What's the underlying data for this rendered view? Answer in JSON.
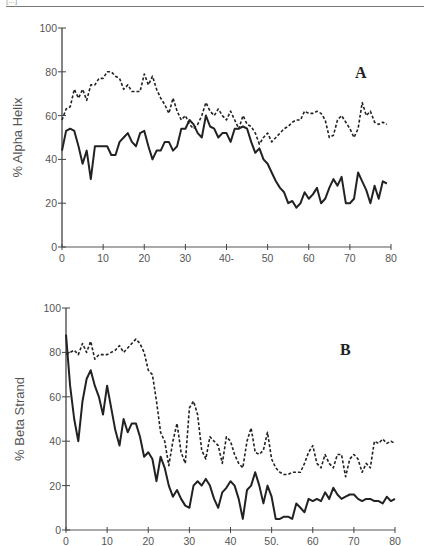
{
  "header": {
    "fragment": "[...]"
  },
  "chart_data": [
    {
      "type": "line",
      "panel_label": "A",
      "title": "",
      "xlabel": "",
      "ylabel": "% Alpha Helix",
      "xlim": [
        0,
        80
      ],
      "ylim": [
        0,
        100
      ],
      "xticks": [
        "0",
        "10",
        "20",
        "30",
        "40-",
        "50",
        "60",
        "70",
        "80"
      ],
      "yticks": [
        "0",
        "20",
        "40",
        "60",
        "80",
        "100"
      ],
      "grid": false,
      "legend": "none",
      "x": [
        0,
        1,
        2,
        3,
        4,
        5,
        6,
        7,
        8,
        9,
        10,
        11,
        12,
        13,
        14,
        15,
        16,
        17,
        18,
        19,
        20,
        21,
        22,
        23,
        24,
        25,
        26,
        27,
        28,
        29,
        30,
        31,
        32,
        33,
        34,
        35,
        36,
        37,
        38,
        39,
        40,
        41,
        42,
        43,
        44,
        45,
        46,
        47,
        48,
        49,
        50,
        51,
        52,
        53,
        54,
        55,
        56,
        57,
        58,
        59,
        60,
        61,
        62,
        63,
        64,
        65,
        66,
        67,
        68,
        69,
        70,
        71,
        72,
        73,
        74,
        75,
        76,
        77,
        78,
        79
      ],
      "series": [
        {
          "name": "dashed",
          "style": "dashed",
          "values": [
            58,
            63,
            64,
            72,
            68,
            72,
            67,
            74,
            74,
            77,
            77,
            80,
            80,
            78,
            77,
            72,
            74,
            71,
            71,
            71,
            79,
            74,
            78,
            72,
            68,
            65,
            61,
            68,
            62,
            58,
            60,
            56,
            54,
            56,
            60,
            66,
            62,
            60,
            63,
            60,
            58,
            62,
            58,
            54,
            60,
            56,
            55,
            52,
            47,
            50,
            52,
            48,
            50,
            52,
            54,
            55,
            57,
            58,
            58,
            62,
            61,
            61,
            62,
            61,
            58,
            50,
            51,
            58,
            60,
            57,
            54,
            50,
            54,
            66,
            60,
            62,
            57,
            56,
            57,
            56
          ]
        },
        {
          "name": "solid",
          "style": "solid",
          "values": [
            44,
            53,
            54,
            53,
            46,
            38,
            44,
            31,
            46,
            46,
            46,
            46,
            42,
            42,
            48,
            50,
            52,
            48,
            46,
            52,
            53,
            46,
            40,
            44,
            44,
            48,
            48,
            44,
            46,
            54,
            54,
            58,
            56,
            52,
            50,
            60,
            55,
            54,
            50,
            52,
            52,
            48,
            54,
            54,
            55,
            54,
            48,
            43,
            45,
            40,
            38,
            34,
            30,
            27,
            25,
            20,
            21,
            18,
            20,
            25,
            22,
            24,
            27,
            20,
            22,
            27,
            31,
            28,
            32,
            20,
            20,
            22,
            34,
            30,
            26,
            20,
            28,
            22,
            30,
            29
          ]
        }
      ]
    },
    {
      "type": "line",
      "panel_label": "B",
      "title": "",
      "xlabel": "",
      "ylabel": "% Beta Strand",
      "xlim": [
        0,
        80
      ],
      "ylim": [
        0,
        100
      ],
      "xticks": [
        "0",
        "10",
        "20",
        "30",
        "40",
        "50.",
        "60",
        "70",
        "80"
      ],
      "yticks": [
        "0",
        "20",
        "40",
        "60",
        "80",
        "100"
      ],
      "grid": false,
      "legend": "none",
      "x": [
        0,
        1,
        2,
        3,
        4,
        5,
        6,
        7,
        8,
        9,
        10,
        11,
        12,
        13,
        14,
        15,
        16,
        17,
        18,
        19,
        20,
        21,
        22,
        23,
        24,
        25,
        26,
        27,
        28,
        29,
        30,
        31,
        32,
        33,
        34,
        35,
        36,
        37,
        38,
        39,
        40,
        41,
        42,
        43,
        44,
        45,
        46,
        47,
        48,
        49,
        50,
        51,
        52,
        53,
        54,
        55,
        56,
        57,
        58,
        59,
        60,
        61,
        62,
        63,
        64,
        65,
        66,
        67,
        68,
        69,
        70,
        71,
        72,
        73,
        74,
        75,
        76,
        77,
        78,
        79,
        80
      ],
      "series": [
        {
          "name": "dashed",
          "style": "dashed",
          "values": [
            79,
            80,
            81,
            79,
            84,
            80,
            85,
            77,
            79,
            79,
            79,
            80,
            81,
            83,
            80,
            82,
            84,
            86,
            84,
            80,
            72,
            70,
            58,
            44,
            40,
            29,
            40,
            48,
            35,
            30,
            55,
            58,
            52,
            36,
            32,
            42,
            40,
            38,
            30,
            42,
            40,
            34,
            30,
            28,
            40,
            46,
            35,
            34,
            36,
            44,
            32,
            28,
            26,
            25,
            25,
            26,
            26,
            26,
            30,
            35,
            38,
            30,
            28,
            34,
            30,
            28,
            34,
            34,
            24,
            32,
            34,
            32,
            26,
            30,
            28,
            40,
            39,
            41,
            39,
            40,
            39
          ]
        },
        {
          "name": "solid",
          "style": "solid",
          "values": [
            88,
            65,
            50,
            40,
            58,
            68,
            72,
            65,
            60,
            52,
            65,
            55,
            45,
            38,
            50,
            44,
            48,
            48,
            42,
            33,
            35,
            32,
            22,
            33,
            28,
            20,
            15,
            18,
            14,
            11,
            10,
            20,
            22,
            20,
            23,
            20,
            14,
            10,
            17,
            19,
            22,
            20,
            14,
            5,
            18,
            20,
            26,
            20,
            12,
            20,
            15,
            5,
            5,
            6,
            6,
            5,
            12,
            10,
            8,
            14,
            13,
            14,
            13,
            17,
            14,
            19,
            16,
            14,
            15,
            16,
            16,
            14,
            13,
            14,
            14,
            13,
            13,
            12,
            15,
            13,
            14
          ]
        }
      ]
    }
  ]
}
